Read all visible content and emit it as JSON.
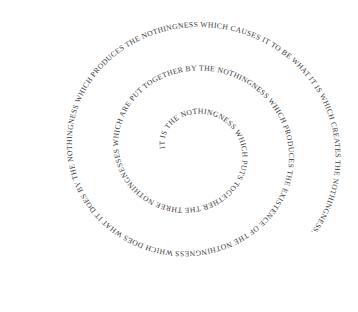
{
  "artwork": {
    "spiral_text": "IT IS THE NOTHINGNESS WHICH PUTS TOGETHER THE THREE NOTHINGNESSES WHICH ARE PUT TOGETHER BY THE NOTHINGNESS WHICH PRODUCES THE EXISTENCE OF THE NOTHINGNESS WHICH DOES WHAT IT DOES BY THE NOTHINGNESS WHICH PRODUCES THE NOTHINGNESS WHICH CAUSES IT TO BE WHAT IT IS WHICH CREATES THE NOTHINGNESS.",
    "text_color": "#3a3a3a",
    "background_color": "#ffffff"
  }
}
